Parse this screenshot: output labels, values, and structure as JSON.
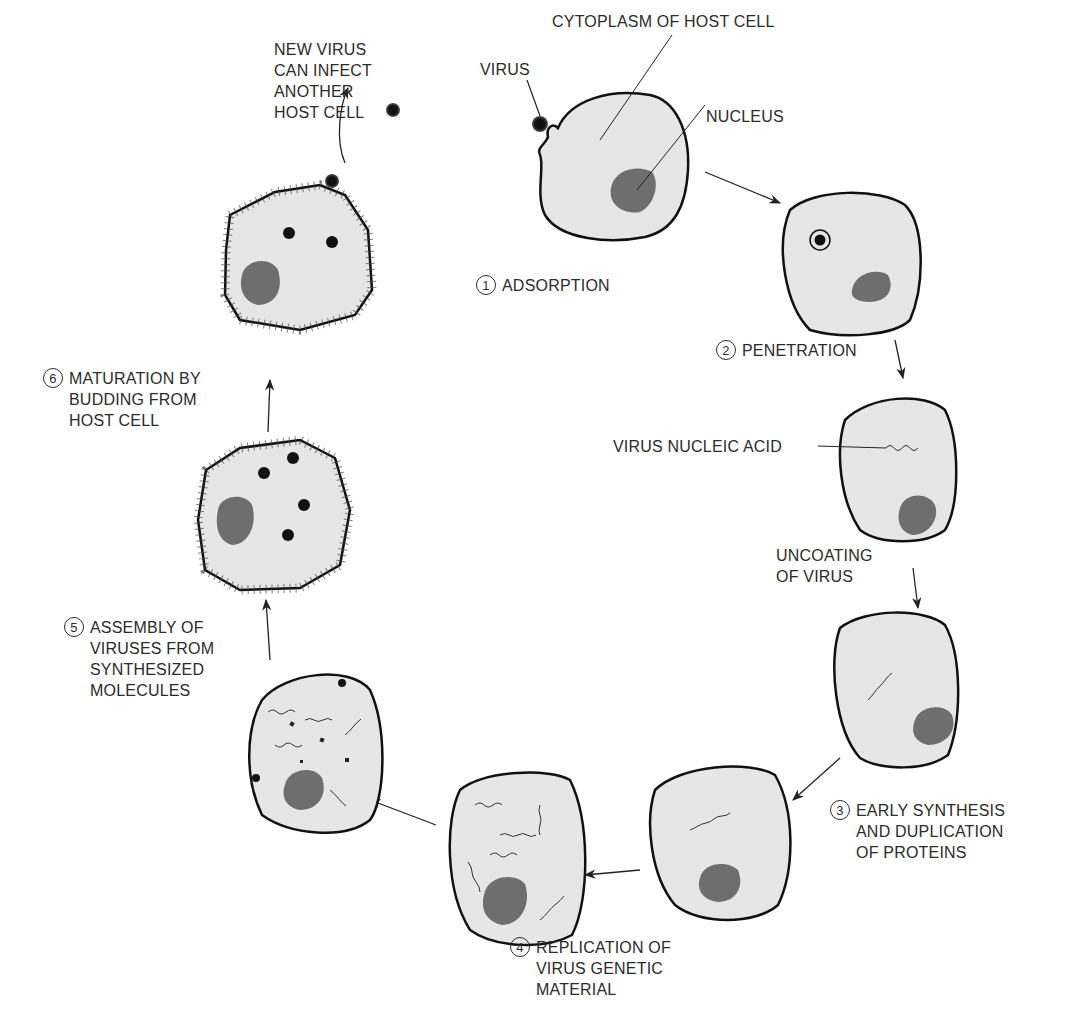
{
  "colors": {
    "cell_fill": "#e6e6e6",
    "cell_outline": "#111111",
    "nucleus": "#6e6e6e",
    "virus": "#111111",
    "text": "#2b2b2b"
  },
  "labels": {
    "virus": "VIRUS",
    "cytoplasm": "CYTOPLASM OF HOST CELL",
    "nucleus": "NUCLEUS",
    "new_virus": "NEW VIRUS\nCAN INFECT\nANOTHER\nHOST CELL",
    "virus_nucleic_acid": "VIRUS NUCLEIC ACID",
    "uncoating": "UNCOATING\nOF VIRUS"
  },
  "steps": [
    {
      "number": "1",
      "text": "ADSORPTION"
    },
    {
      "number": "2",
      "text": "PENETRATION"
    },
    {
      "number": "3",
      "text": "EARLY SYNTHESIS\nAND DUPLICATION\nOF PROTEINS"
    },
    {
      "number": "4",
      "text": "REPLICATION OF\nVIRUS GENETIC\nMATERIAL"
    },
    {
      "number": "5",
      "text": "ASSEMBLY OF\nVIRUSES FROM\nSYNTHESIZED\nMOLECULES"
    },
    {
      "number": "6",
      "text": "MATURATION BY\nBUDDING FROM\nHOST CELL"
    }
  ]
}
